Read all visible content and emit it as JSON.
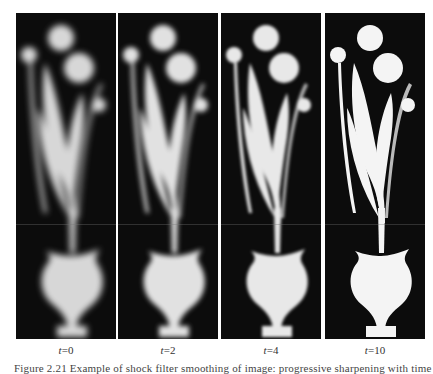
{
  "figure": {
    "panels": [
      {
        "id": "t0",
        "label_var": "t",
        "label_eq": "=",
        "label_val": "0",
        "blur": 3.2,
        "brightness": 0.88
      },
      {
        "id": "t2",
        "label_var": "t",
        "label_eq": "=",
        "label_val": "2",
        "blur": 2.4,
        "brightness": 0.92
      },
      {
        "id": "t4",
        "label_var": "t",
        "label_eq": "=",
        "label_val": "4",
        "blur": 1.5,
        "brightness": 0.95
      },
      {
        "id": "t10",
        "label_var": "t",
        "label_eq": "=",
        "label_val": "10",
        "blur": 0.5,
        "brightness": 1.0
      }
    ],
    "colors": {
      "background": "#0c0c0c",
      "shape": "#f4f4f4",
      "page": "#ffffff"
    },
    "caption": "Figure 2.21  Example of shock filter smoothing of image: progressive sharpening with time"
  }
}
